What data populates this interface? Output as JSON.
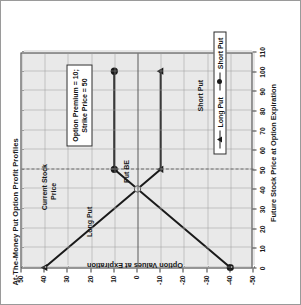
{
  "figure": {
    "title": "At-The-Money Put Option Profit Profiles",
    "params_line1": "Option Premium = 10;",
    "params_line2": "Strike Price = 50",
    "current_price_label_line1": "Current Stock",
    "current_price_label_line2": "Price",
    "breakeven_label": "Put BE",
    "long_put_inline_label": "Long Put",
    "short_put_inline_label": "Short Put"
  },
  "legend": {
    "position": "inside-right",
    "items": [
      {
        "label": "Long Put",
        "marker": "triangle-marker-icon",
        "color": "#1a1a1a"
      },
      {
        "label": "Short Put",
        "marker": "circle-marker-icon",
        "color": "#1a1a1a"
      }
    ]
  },
  "chart_data": {
    "type": "line",
    "title": "At-The-Money Put Option Profit Profiles",
    "xlabel": "Future Stock Price at Option Expiration",
    "ylabel": "Option Values at Expiration",
    "xlim": [
      0,
      110
    ],
    "ylim": [
      -50,
      50
    ],
    "xticks": [
      0,
      10,
      20,
      30,
      40,
      50,
      60,
      70,
      80,
      90,
      100,
      110
    ],
    "yticks": [
      50,
      40,
      30,
      20,
      10,
      0,
      -10,
      -20,
      -30,
      -40,
      -50
    ],
    "xtick_labels": [
      "0",
      "10",
      "20",
      "30",
      "40",
      "50",
      "60",
      "70",
      "80",
      "90",
      "100",
      "110"
    ],
    "ytick_labels": [
      "50",
      "40",
      "30",
      "20",
      "10",
      "0",
      "-10",
      "-20",
      "-30",
      "-40",
      "-50"
    ],
    "grid": true,
    "legend_position": "inside-right",
    "series": [
      {
        "name": "Long Put",
        "marker": "triangle",
        "color": "#1a1a1a",
        "x": [
          0,
          40,
          50,
          100
        ],
        "values": [
          40,
          0,
          -10,
          -10
        ],
        "marker_points": [
          [
            0,
            40
          ],
          [
            50,
            -10
          ],
          [
            100,
            -10
          ]
        ]
      },
      {
        "name": "Short Put",
        "marker": "circle",
        "color": "#1a1a1a",
        "x": [
          0,
          40,
          50,
          100
        ],
        "values": [
          -40,
          0,
          10,
          10
        ],
        "marker_points": [
          [
            0,
            -40
          ],
          [
            50,
            10
          ],
          [
            100,
            10
          ]
        ]
      }
    ],
    "annotations": [
      {
        "text": "Put BE",
        "x": 40,
        "y": 0
      },
      {
        "text": "Current Stock Price",
        "x": 50,
        "y": 30,
        "type": "vline-dashed"
      },
      {
        "text": "Option Premium = 10; Strike Price = 50",
        "x": 72,
        "y": 22,
        "type": "textbox"
      },
      {
        "text": "Long Put",
        "x": 16,
        "y": 22,
        "type": "inline-series-label"
      },
      {
        "text": "Short Put",
        "x": 80,
        "y": -26,
        "type": "inline-series-label"
      }
    ],
    "option_premium": 10,
    "strike_price": 50,
    "breakeven": 40
  }
}
